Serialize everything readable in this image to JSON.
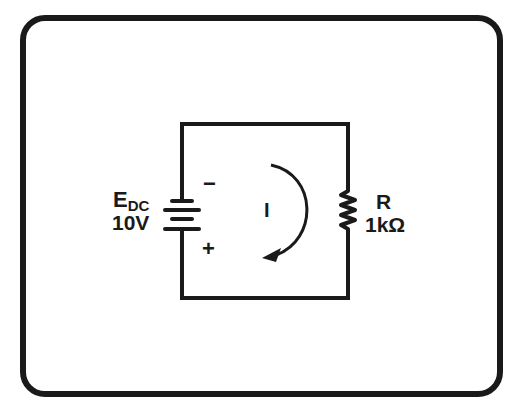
{
  "diagram": {
    "type": "series-dc-circuit",
    "source": {
      "symbol_main": "E",
      "symbol_sub": "DC",
      "value": "10V",
      "negative_terminal": "−",
      "positive_terminal": "+"
    },
    "resistor": {
      "symbol": "R",
      "value": "1kΩ"
    },
    "current": {
      "symbol": "I",
      "direction": "clockwise"
    },
    "colors": {
      "ink": "#1a1a1a",
      "background": "#ffffff"
    }
  }
}
